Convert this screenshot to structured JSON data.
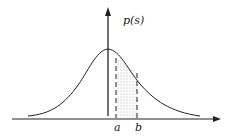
{
  "diagram": {
    "y_axis_label": "p(s)",
    "x_markers": [
      "a",
      "b"
    ],
    "curve": "bell-shaped (normal) density",
    "shaded_region": "area under curve between a and b (dotted fill, dashed boundaries)",
    "colors": {
      "line": "#222222",
      "background": "#ffffff",
      "fill_dots": "#555555"
    }
  }
}
